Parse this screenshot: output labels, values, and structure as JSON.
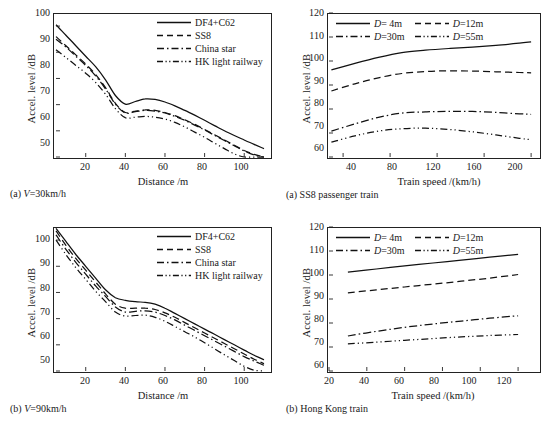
{
  "figure": {
    "background": "#ffffff",
    "line_color": "#111111"
  },
  "panels": {
    "a_left": {
      "caption_prefix": "(a)",
      "caption_text": "V=30km/h",
      "caption_italic": "V",
      "caption_rest": "=30km/h",
      "xlabel": "Distance /m",
      "ylabel": "Accel. level /dB",
      "yticks": [
        "100",
        "90",
        "80",
        "70",
        "60",
        "50"
      ],
      "xticks": [
        "20",
        "40",
        "60",
        "80",
        "100"
      ],
      "legend": [
        {
          "label": "DF4+C62",
          "style": "solid"
        },
        {
          "label": "SS8",
          "style": "dashed"
        },
        {
          "label": "China star",
          "style": "dashdot"
        },
        {
          "label": "HK light railway",
          "style": "dashdotdot"
        }
      ]
    },
    "b_left": {
      "caption_prefix": "(b)",
      "caption_italic": "V",
      "caption_rest": "=90km/h",
      "xlabel": "Distance /m",
      "ylabel": "Accel. level /dB",
      "yticks": [
        "100",
        "90",
        "80",
        "70",
        "60",
        "50"
      ],
      "xticks": [
        "20",
        "40",
        "60",
        "80",
        "100"
      ],
      "legend": [
        {
          "label": "DF4+C62",
          "style": "solid"
        },
        {
          "label": "SS8",
          "style": "dashed"
        },
        {
          "label": "China star",
          "style": "dashdot"
        },
        {
          "label": "HK light railway",
          "style": "dashdotdot"
        }
      ]
    },
    "a_right": {
      "caption_prefix": "(a)",
      "caption_text": "SS8 passenger train",
      "xlabel": "Train speed /(km/h)",
      "ylabel": "Accel. level /dB",
      "yticks": [
        "120",
        "110",
        "100",
        "90",
        "80",
        "70",
        "60"
      ],
      "xticks": [
        "40",
        "80",
        "120",
        "160",
        "200"
      ],
      "legend": [
        {
          "italic": "D",
          "label": "=  4m",
          "style": "solid"
        },
        {
          "italic": "D",
          "label": "=12m",
          "style": "dashed"
        },
        {
          "italic": "D",
          "label": "=30m",
          "style": "dashdot"
        },
        {
          "italic": "D",
          "label": "=55m",
          "style": "dashdotdot"
        }
      ]
    },
    "b_right": {
      "caption_prefix": "(b)",
      "caption_text": "Hong Kong train",
      "xlabel": "Train speed /(km/h)",
      "ylabel": "Accel. level /dB",
      "yticks": [
        "120",
        "110",
        "100",
        "90",
        "80",
        "70",
        "60"
      ],
      "xticks": [
        "20",
        "40",
        "60",
        "80",
        "100",
        "120"
      ],
      "legend": [
        {
          "italic": "D",
          "label": "=  4m",
          "style": "solid"
        },
        {
          "italic": "D",
          "label": "=12m",
          "style": "dashed"
        },
        {
          "italic": "D",
          "label": "=30m",
          "style": "dashdot"
        },
        {
          "italic": "D",
          "label": "=55m",
          "style": "dashdotdot"
        }
      ]
    }
  },
  "chart_data": [
    {
      "id": "a_left",
      "type": "line",
      "title": "(a) V=30km/h",
      "xlabel": "Distance /m",
      "ylabel": "Accel. level /dB",
      "xlim": [
        5,
        112
      ],
      "ylim": [
        50,
        105
      ],
      "xticks": [
        20,
        40,
        60,
        80,
        100
      ],
      "yticks": [
        50,
        60,
        70,
        80,
        90,
        100
      ],
      "grid": false,
      "legend_position": "top-right",
      "x": [
        5,
        10,
        15,
        20,
        25,
        30,
        35,
        40,
        45,
        50,
        55,
        60,
        65,
        70,
        75,
        80,
        85,
        90,
        95,
        100,
        105,
        110
      ],
      "series": [
        {
          "name": "DF4+C62",
          "style": "solid",
          "values": [
            100.5,
            96.5,
            92.5,
            88.5,
            84.5,
            79.5,
            73.5,
            70.2,
            71.2,
            72.2,
            72.0,
            71.0,
            69.5,
            67.8,
            66.0,
            64.0,
            62.0,
            60.0,
            58.2,
            56.5,
            54.8,
            53.2
          ]
        },
        {
          "name": "SS8",
          "style": "dashed",
          "values": [
            96.0,
            92.5,
            89.0,
            85.5,
            81.5,
            76.5,
            70.5,
            67.0,
            67.5,
            68.0,
            67.8,
            67.0,
            65.8,
            64.2,
            62.5,
            60.5,
            58.5,
            56.5,
            54.5,
            52.5,
            51.0,
            50.0
          ]
        },
        {
          "name": "China star",
          "style": "dashdot",
          "values": [
            95.0,
            92.0,
            88.5,
            85.0,
            81.0,
            76.0,
            70.2,
            66.8,
            67.3,
            67.8,
            67.5,
            66.8,
            65.5,
            64.0,
            62.2,
            60.3,
            58.3,
            56.3,
            54.3,
            52.3,
            50.8,
            50.0
          ]
        },
        {
          "name": "HK light railway",
          "style": "dashdotdot",
          "values": [
            91.0,
            88.0,
            85.0,
            82.0,
            78.5,
            74.0,
            68.5,
            65.0,
            65.2,
            65.5,
            65.2,
            64.5,
            63.2,
            61.5,
            59.5,
            57.5,
            55.3,
            53.2,
            51.2,
            50.0,
            50.0,
            50.0
          ]
        }
      ]
    },
    {
      "id": "b_left",
      "type": "line",
      "title": "(b) V=90km/h",
      "xlabel": "Distance /m",
      "ylabel": "Accel. level /dB",
      "xlim": [
        5,
        112
      ],
      "ylim": [
        50,
        105
      ],
      "xticks": [
        20,
        40,
        60,
        80,
        100
      ],
      "yticks": [
        50,
        60,
        70,
        80,
        90,
        100
      ],
      "grid": false,
      "legend_position": "top-right",
      "x": [
        5,
        10,
        15,
        20,
        25,
        30,
        35,
        40,
        45,
        50,
        55,
        60,
        65,
        70,
        75,
        80,
        85,
        90,
        95,
        100,
        105,
        110
      ],
      "series": [
        {
          "name": "DF4+C62",
          "style": "solid",
          "values": [
            104.5,
            99.5,
            94.5,
            90.0,
            85.5,
            81.0,
            78.0,
            77.0,
            76.5,
            76.2,
            75.5,
            74.0,
            72.0,
            70.0,
            68.0,
            66.0,
            64.0,
            62.0,
            60.0,
            58.0,
            56.0,
            54.3
          ]
        },
        {
          "name": "SS8",
          "style": "dashed",
          "values": [
            103.5,
            98.0,
            93.0,
            88.5,
            84.0,
            79.5,
            75.5,
            74.0,
            74.0,
            74.0,
            73.5,
            72.2,
            70.5,
            68.5,
            66.5,
            64.5,
            62.5,
            60.5,
            58.5,
            56.5,
            54.5,
            52.8
          ]
        },
        {
          "name": "China star",
          "style": "dashdot",
          "values": [
            102.0,
            96.5,
            91.5,
            87.0,
            82.5,
            78.5,
            74.5,
            72.5,
            72.8,
            73.0,
            72.5,
            71.2,
            69.5,
            67.5,
            65.5,
            63.5,
            61.5,
            59.5,
            57.5,
            55.5,
            53.8,
            52.2
          ]
        },
        {
          "name": "HK light railway",
          "style": "dashdotdot",
          "values": [
            100.0,
            94.5,
            89.5,
            85.0,
            80.5,
            76.5,
            72.5,
            71.0,
            71.2,
            71.3,
            70.5,
            69.0,
            67.0,
            65.0,
            63.0,
            60.8,
            58.5,
            56.2,
            54.0,
            51.8,
            50.3,
            50.0
          ]
        }
      ]
    },
    {
      "id": "a_right",
      "type": "line",
      "title": "(a) SS8 passenger train",
      "xlabel": "Train speed /(km/h)",
      "ylabel": "Accel. level /dB",
      "xlim": [
        28,
        205
      ],
      "ylim": [
        60,
        120
      ],
      "xticks": [
        40,
        80,
        120,
        160,
        200
      ],
      "yticks": [
        60,
        70,
        80,
        90,
        100,
        110,
        120
      ],
      "grid": false,
      "legend_position": "top-inside",
      "x": [
        30,
        50,
        70,
        90,
        110,
        130,
        150,
        170,
        190,
        200
      ],
      "series": [
        {
          "name": "D=4m",
          "style": "solid",
          "values": [
            96.3,
            99.0,
            101.5,
            103.5,
            104.5,
            105.2,
            105.8,
            106.5,
            107.4,
            108.0
          ]
        },
        {
          "name": "D=12m",
          "style": "dashed",
          "values": [
            87.5,
            90.5,
            93.0,
            94.8,
            95.6,
            95.9,
            95.8,
            95.5,
            95.2,
            95.1
          ]
        },
        {
          "name": "D=30m",
          "style": "dashdot",
          "values": [
            70.8,
            73.8,
            76.5,
            78.3,
            78.8,
            79.0,
            79.0,
            78.6,
            78.0,
            77.8
          ]
        },
        {
          "name": "D=55m",
          "style": "dashdotdot",
          "values": [
            66.2,
            68.8,
            70.8,
            71.8,
            72.0,
            71.5,
            70.5,
            69.2,
            67.8,
            67.2
          ]
        }
      ]
    },
    {
      "id": "b_right",
      "type": "line",
      "title": "(b) Hong Kong train",
      "xlabel": "Train speed /(km/h)",
      "ylabel": "Accel. level /dB",
      "xlim": [
        20,
        130
      ],
      "ylim": [
        60,
        120
      ],
      "xticks": [
        20,
        40,
        60,
        80,
        100,
        120
      ],
      "yticks": [
        60,
        70,
        80,
        90,
        100,
        110,
        120
      ],
      "grid": false,
      "legend_position": "top-inside",
      "x": [
        30,
        45,
        60,
        75,
        90,
        105,
        120
      ],
      "series": [
        {
          "name": "D=4m",
          "style": "solid",
          "values": [
            101.2,
            102.5,
            103.8,
            105.0,
            106.2,
            107.4,
            108.6
          ]
        },
        {
          "name": "D=12m",
          "style": "dashed",
          "values": [
            92.6,
            93.8,
            95.0,
            96.2,
            97.4,
            98.7,
            100.2
          ]
        },
        {
          "name": "D=30m",
          "style": "dashdot",
          "values": [
            74.6,
            76.5,
            78.2,
            79.6,
            80.8,
            82.0,
            83.0
          ]
        },
        {
          "name": "D=55m",
          "style": "dashdotdot",
          "values": [
            71.3,
            72.0,
            72.8,
            73.5,
            74.2,
            74.8,
            75.2
          ]
        }
      ]
    }
  ]
}
